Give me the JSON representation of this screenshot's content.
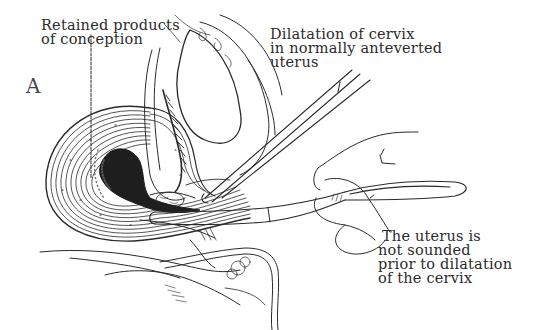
{
  "figure": {
    "panel_letter": "A",
    "labels": {
      "retained_products": {
        "lines": [
          "Retained products",
          "of conception"
        ]
      },
      "dilatation": {
        "lines": [
          "Dilatation of cervix",
          "in normally anteverted",
          "uterus"
        ]
      },
      "not_sounded": {
        "lines": [
          "The uterus is",
          "not sounded",
          "prior to dilatation",
          "of the cervix"
        ]
      }
    },
    "colors": {
      "ink": "#2a2a2a",
      "background": "#ffffff"
    }
  }
}
